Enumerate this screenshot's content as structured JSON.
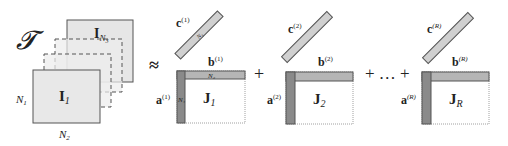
{
  "diagram": {
    "tensor": {
      "symbol": "𝓣",
      "front_matrix": {
        "label": "I",
        "subscript": "1"
      },
      "back_matrix": {
        "label": "I",
        "subscript": "N3"
      },
      "dim_rows": "N",
      "dim_rows_sub": "1",
      "dim_cols": "N",
      "dim_cols_sub": "2"
    },
    "approx_symbol": "≈",
    "plus_symbol": "+",
    "ellipsis": "+ … +",
    "terms": [
      {
        "c": "c",
        "c_sup": "(1)",
        "b": "b",
        "b_sup": "(1)",
        "a": "a",
        "a_sup": "(1)",
        "J": "J",
        "J_sub": "1",
        "c_dim": "N3",
        "b_dim": "N2",
        "a_dim": "N1"
      },
      {
        "c": "c",
        "c_sup": "(2)",
        "b": "b",
        "b_sup": "(2)",
        "a": "a",
        "a_sup": "(2)",
        "J": "J",
        "J_sub": "2"
      },
      {
        "c": "c",
        "c_sup": "(R)",
        "b": "b",
        "b_sup": "(R)",
        "a": "a",
        "a_sup": "(R)",
        "J": "J",
        "J_sub": "R"
      }
    ],
    "colors": {
      "matrix_fill": "#e8e8e8",
      "vector_light": "#cfcfcf",
      "vector_dark": "#8a8a8a",
      "stroke": "#555555"
    }
  }
}
